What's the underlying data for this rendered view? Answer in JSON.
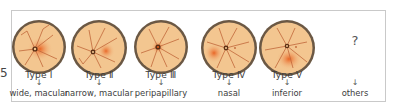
{
  "figure": {
    "side_label": "5",
    "items": [
      {
        "type": "Type Ⅰ",
        "arrow": "↓",
        "description": "wide, macular",
        "spot": {
          "cx": 0,
          "cy": 2,
          "rx": 12,
          "ry": 11
        },
        "disc": {
          "cx": -4,
          "cy": 2
        }
      },
      {
        "type": "Type Ⅱ",
        "arrow": "↓",
        "description": "narrow, macular",
        "spot": {
          "cx": 7,
          "cy": 3,
          "rx": 8,
          "ry": 8
        },
        "disc": {
          "cx": -6,
          "cy": 4
        }
      },
      {
        "type": "Type Ⅲ",
        "arrow": "↓",
        "description": "peripapillary",
        "spot": {
          "cx": -3,
          "cy": 0,
          "rx": 6,
          "ry": 6
        },
        "disc": {
          "cx": -3,
          "cy": 0
        }
      },
      {
        "type": "Type Ⅳ",
        "arrow": "↓",
        "description": "nasal",
        "spot": {
          "cx": -16,
          "cy": 5,
          "rx": 9,
          "ry": 9
        },
        "disc": {
          "cx": -3,
          "cy": 0
        }
      },
      {
        "type": "Type Ⅴ",
        "arrow": "↓",
        "description": "inferior",
        "spot": {
          "cx": 2,
          "cy": 10,
          "rx": 12,
          "ry": 11
        },
        "disc": {
          "cx": 0,
          "cy": 0
        }
      }
    ],
    "others": {
      "symbol": "?",
      "arrow": "↓",
      "description": "others"
    },
    "colors": {
      "rim": "#6b5844",
      "fundus": "#f3c690",
      "vessel": "#c0673a",
      "spot": "#e8692a",
      "border": "#c9c9c9"
    }
  }
}
